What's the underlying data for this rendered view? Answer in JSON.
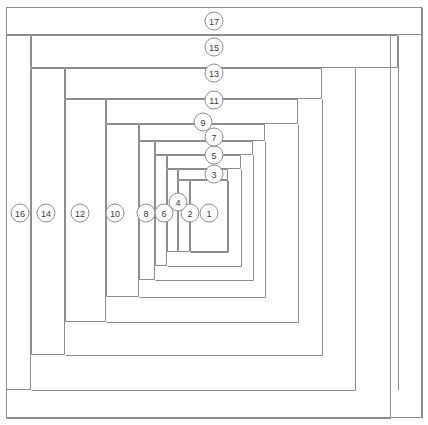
{
  "diagram": {
    "type": "log-cabin-quilt-block-piecing-diagram",
    "title": "Log Cabin Block Piecing Order",
    "canvas": {
      "width": 428,
      "height": 425
    },
    "colors": {
      "line": "#8d8d8d",
      "fill": "#ffffff",
      "label": "#3c3c3c",
      "background": "#ffffff"
    },
    "outer_border": {
      "x": 6,
      "y": 7,
      "width": 416,
      "height": 411
    },
    "marker_radius": 9,
    "pieces": [
      {
        "number": "1",
        "x": 190,
        "y": 180,
        "width": 38,
        "height": 72,
        "label_x": 209,
        "label_y": 213
      },
      {
        "number": "2",
        "x": 178,
        "y": 180,
        "width": 12,
        "height": 72,
        "label_x": 190,
        "label_y": 213
      },
      {
        "number": "3",
        "x": 178,
        "y": 169,
        "width": 50,
        "height": 11,
        "label_x": 214,
        "label_y": 174
      },
      {
        "number": "4",
        "x": 167,
        "y": 169,
        "width": 11,
        "height": 83,
        "label_x": 178,
        "label_y": 202
      },
      {
        "number": "5",
        "x": 167,
        "y": 155,
        "width": 74,
        "height": 14,
        "label_x": 214,
        "label_y": 155
      },
      {
        "number": "6",
        "x": 155,
        "y": 155,
        "width": 12,
        "height": 111,
        "label_x": 164,
        "label_y": 213
      },
      {
        "number": "7",
        "x": 155,
        "y": 141,
        "width": 98,
        "height": 14,
        "label_x": 214,
        "label_y": 137
      },
      {
        "number": "8",
        "x": 139,
        "y": 141,
        "width": 16,
        "height": 139,
        "label_x": 146,
        "label_y": 213
      },
      {
        "number": "9",
        "x": 139,
        "y": 124,
        "width": 126,
        "height": 17,
        "label_x": 203,
        "label_y": 122
      },
      {
        "number": "10",
        "x": 106,
        "y": 124,
        "width": 33,
        "height": 173,
        "label_x": 115,
        "label_y": 213
      },
      {
        "number": "11",
        "x": 106,
        "y": 99,
        "width": 192,
        "height": 25,
        "label_x": 214,
        "label_y": 100
      },
      {
        "number": "12",
        "x": 65,
        "y": 99,
        "width": 41,
        "height": 223,
        "label_x": 80,
        "label_y": 213
      },
      {
        "number": "13",
        "x": 65,
        "y": 68,
        "width": 257,
        "height": 31,
        "label_x": 214,
        "label_y": 73
      },
      {
        "number": "14",
        "x": 31,
        "y": 68,
        "width": 34,
        "height": 287,
        "label_x": 46,
        "label_y": 213
      },
      {
        "number": "15",
        "x": 31,
        "y": 35,
        "width": 367,
        "height": 33,
        "label_x": 214,
        "label_y": 47
      },
      {
        "number": "16",
        "x": 6,
        "y": 35,
        "width": 25,
        "height": 355,
        "label_x": 20,
        "label_y": 213
      },
      {
        "number": "17",
        "x": 6,
        "y": 7,
        "width": 416,
        "height": 28,
        "label_x": 214,
        "label_y": 21
      }
    ],
    "extra_lines": [
      {
        "name": "inner-right-edge-1",
        "x1": 228,
        "y1": 180,
        "x2": 228,
        "y2": 252
      },
      {
        "name": "inner-bottom-edge-1",
        "x1": 190,
        "y1": 252,
        "x2": 228,
        "y2": 252
      },
      {
        "name": "inner-right-edge-4",
        "x1": 241,
        "y1": 169,
        "x2": 241,
        "y2": 266
      },
      {
        "name": "inner-bottom-edge-4",
        "x1": 167,
        "y1": 266,
        "x2": 241,
        "y2": 266
      },
      {
        "name": "inner-right-edge-6",
        "x1": 253,
        "y1": 155,
        "x2": 253,
        "y2": 280
      },
      {
        "name": "inner-bottom-edge-6",
        "x1": 155,
        "y1": 280,
        "x2": 253,
        "y2": 280
      },
      {
        "name": "inner-right-edge-8",
        "x1": 265,
        "y1": 141,
        "x2": 265,
        "y2": 297
      },
      {
        "name": "inner-bottom-edge-8",
        "x1": 139,
        "y1": 297,
        "x2": 265,
        "y2": 297
      },
      {
        "name": "inner-right-edge-10",
        "x1": 298,
        "y1": 124,
        "x2": 298,
        "y2": 322
      },
      {
        "name": "inner-bottom-edge-10",
        "x1": 106,
        "y1": 322,
        "x2": 298,
        "y2": 322
      },
      {
        "name": "inner-right-edge-12",
        "x1": 322,
        "y1": 99,
        "x2": 322,
        "y2": 355
      },
      {
        "name": "inner-bottom-edge-12",
        "x1": 65,
        "y1": 355,
        "x2": 322,
        "y2": 355
      },
      {
        "name": "inner-right-edge-14",
        "x1": 355,
        "y1": 68,
        "x2": 355,
        "y2": 390
      },
      {
        "name": "inner-bottom-edge-14",
        "x1": 31,
        "y1": 390,
        "x2": 355,
        "y2": 390
      },
      {
        "name": "inner-right-edge-16",
        "x1": 390,
        "y1": 35,
        "x2": 390,
        "y2": 418
      },
      {
        "name": "inner-bottom-edge-16",
        "x1": 6,
        "y1": 418,
        "x2": 390,
        "y2": 418
      },
      {
        "name": "inner-right-edge-17",
        "x1": 398,
        "y1": 35,
        "x2": 398,
        "y2": 390
      },
      {
        "name": "strip-17-right-col",
        "x1": 422,
        "y1": 7,
        "x2": 422,
        "y2": 418
      }
    ]
  }
}
